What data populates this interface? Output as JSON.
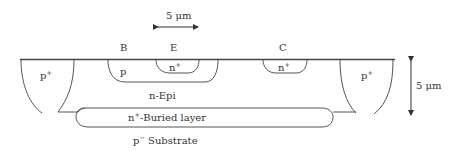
{
  "diagram": {
    "type": "bipolar-transistor-cross-section",
    "terminals": {
      "base": "B",
      "emitter": "E",
      "collector": "C"
    },
    "regions": {
      "left_isolation": {
        "label": "p",
        "superscript": "+"
      },
      "right_isolation": {
        "label": "p",
        "superscript": "+"
      },
      "base_region": {
        "label": "p",
        "superscript": ""
      },
      "emitter_region": {
        "label": "n",
        "superscript": "+"
      },
      "collector_contact": {
        "label": "n",
        "superscript": "+"
      },
      "epi_layer": {
        "label": "n-Epi"
      },
      "buried_layer": {
        "label": "-Buried layer",
        "prefix": "n",
        "superscript": "+"
      },
      "substrate": {
        "label": " Substrate",
        "prefix": "p",
        "superscript": "−"
      }
    },
    "scale_bars": {
      "horizontal": {
        "label": "5 μm",
        "orientation": "horizontal"
      },
      "vertical": {
        "label": "5 μm",
        "orientation": "vertical"
      }
    },
    "colors": {
      "line": "#555555",
      "text": "#333333",
      "background": "#ffffff"
    }
  }
}
